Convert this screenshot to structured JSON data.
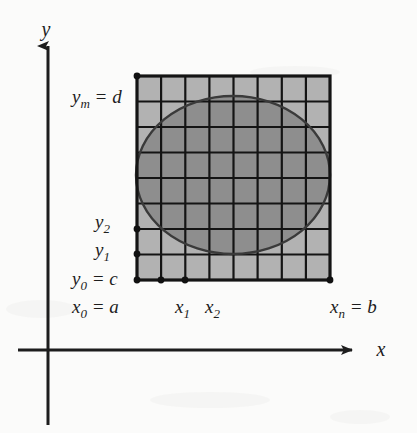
{
  "figure": {
    "background_color": "#fbfbfa",
    "ink_color": "#1d1d1d"
  },
  "axes": {
    "x_label": "x",
    "y_label": "y",
    "origin": {
      "x": 48,
      "y": 350
    },
    "x_axis": {
      "from_x": 18,
      "to_x": 358,
      "y": 350,
      "arrow": "right"
    },
    "y_axis": {
      "x": 48,
      "from_y": 425,
      "to_y": 40,
      "arrow": "up"
    }
  },
  "grid": {
    "columns": 8,
    "rows": 8,
    "left": 137,
    "right": 330,
    "top": 76,
    "bottom": 280,
    "cell_fill_outside": "#b2b2b2",
    "cell_fill_inside": "#8e8e8e",
    "line_color": "#141414",
    "line_width": 2.2,
    "border_width": 3.2
  },
  "region": {
    "shape": "ellipse",
    "center_x": 233,
    "center_y": 175,
    "radius_x": 97,
    "radius_y": 79,
    "stroke": "#3a3a3a",
    "fill": "#8e8e8e"
  },
  "labels": {
    "y_max": {
      "text": "y",
      "sub": "m",
      "rest": " = d",
      "x": 72,
      "y": 103
    },
    "y_two": {
      "text": "y",
      "sub": "2",
      "rest": "",
      "x": 95,
      "y": 228
    },
    "y_one": {
      "text": "y",
      "sub": "1",
      "rest": "",
      "x": 95,
      "y": 256
    },
    "y_zero": {
      "text": "y",
      "sub": "0",
      "rest": " = c",
      "x": 72,
      "y": 285
    },
    "x_zero": {
      "text": "x",
      "sub": "0",
      "rest": " = a",
      "x": 72,
      "y": 313
    },
    "x_one": {
      "text": "x",
      "sub": "1",
      "rest": "",
      "x": 178,
      "y": 313
    },
    "x_two": {
      "text": "x",
      "sub": "2",
      "rest": "",
      "x": 207,
      "y": 313
    },
    "x_n": {
      "text": "x",
      "sub": "n",
      "rest": " = b",
      "x": 332,
      "y": 313
    }
  },
  "tick_dots": {
    "radius": 3.4,
    "color": "#111111",
    "points": [
      {
        "name": "y-max-corner",
        "x": 137,
        "y": 76
      },
      {
        "name": "y-two",
        "x": 137,
        "y": 229
      },
      {
        "name": "y-one",
        "x": 137,
        "y": 254
      },
      {
        "name": "origin-corner",
        "x": 137,
        "y": 280
      },
      {
        "name": "x-one",
        "x": 161,
        "y": 280
      },
      {
        "name": "x-two",
        "x": 185,
        "y": 280
      },
      {
        "name": "x-n",
        "x": 330,
        "y": 280
      }
    ]
  }
}
